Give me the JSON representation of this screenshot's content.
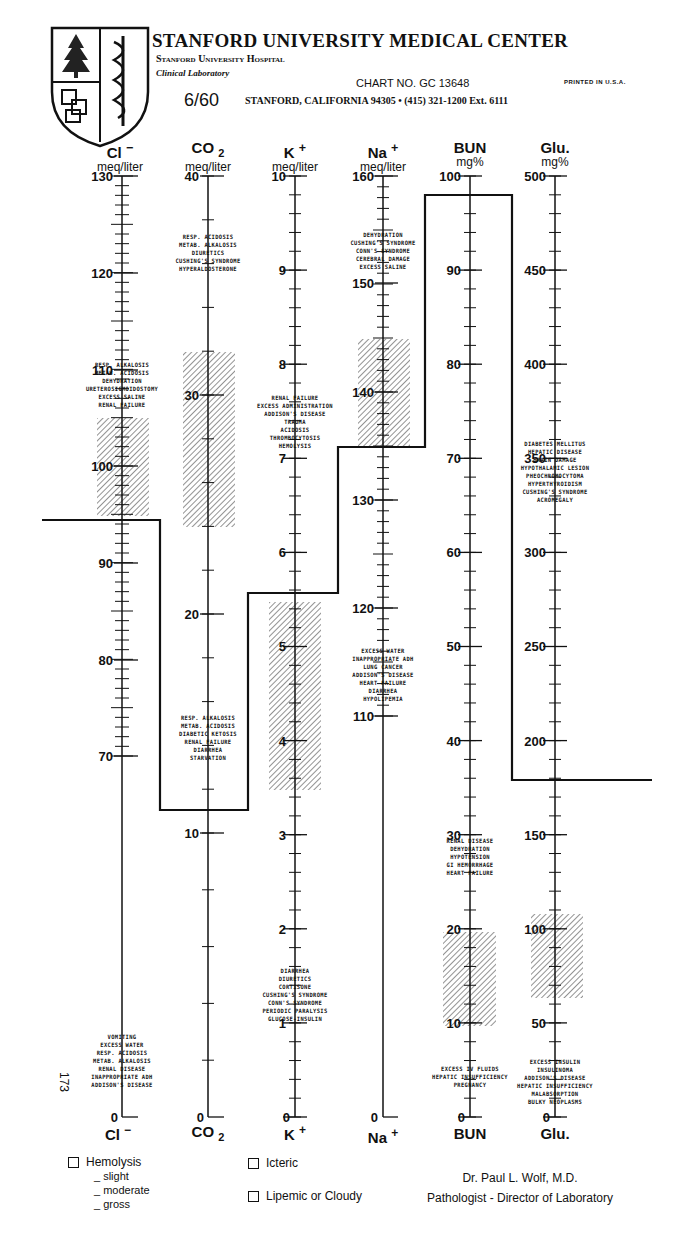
{
  "header": {
    "title": "STANFORD UNIVERSITY MEDICAL CENTER",
    "hospital": "Stanford University Hospital",
    "department": "Clinical Laboratory",
    "chart_number": "CHART NO. GC 13648",
    "printed": "PRINTED IN U.S.A.",
    "revision": "6/60",
    "address": "STANFORD, CALIFORNIA 94305 • (415) 321-1200 Ext. 6111",
    "logo": "stanford-shield-logo"
  },
  "columns": [
    {
      "symbol": "Cl",
      "charge": "−",
      "unit": "meq/liter",
      "foot": "Cl"
    },
    {
      "symbol": "CO",
      "sub": "2",
      "unit": "meq/liter",
      "foot": "CO"
    },
    {
      "symbol": "K",
      "charge": "+",
      "unit": "meq/liter",
      "foot": "K"
    },
    {
      "symbol": "Na",
      "charge": "+",
      "unit": "meq/liter",
      "foot": "Na"
    },
    {
      "symbol": "BUN",
      "unit": "mg%",
      "foot": "BUN"
    },
    {
      "symbol": "Glu.",
      "unit": "mg%",
      "foot": "Glu."
    }
  ],
  "side_number": "173",
  "diagnoses": {
    "cl_high": [
      "RESP. ALKALOSIS",
      "METAB. ACIDOSIS",
      "DEHYDRATION",
      "URETEROSIGMOIDOSTOMY",
      "EXCESS SALINE",
      "RENAL FAILURE"
    ],
    "cl_low": [
      "VOMITING",
      "EXCESS WATER",
      "RESP. ACIDOSIS",
      "METAB. ALKALOSIS",
      "RENAL DISEASE",
      "INAPPROPRIATE ADH",
      "ADDISON'S DISEASE"
    ],
    "co2_high": [
      "RESP. ACIDOSIS",
      "METAB. ALKALOSIS",
      "DIURETICS",
      "CUSHING'S SYNDROME",
      "HYPERALDOSTERONE"
    ],
    "co2_low": [
      "RESP. ALKALOSIS",
      "METAB. ACIDOSIS",
      "DIABETIC KETOSIS",
      "RENAL FAILURE",
      "DIARRHEA",
      "STARVATION"
    ],
    "k_high": [
      "RENAL FAILURE",
      "EXCESS ADMINISTRATION",
      "ADDISON'S DISEASE",
      "TRAUMA",
      "ACIDOSIS",
      "THROMBOCYTOSIS",
      "HEMOLYSIS"
    ],
    "k_low": [
      "DIARRHEA",
      "DIURETICS",
      "CORTISONE",
      "CUSHING'S SYNDROME",
      "CONN'S SYNDROME",
      "PERIODIC PARALYSIS",
      "GLUCOSE-INSULIN"
    ],
    "na_high": [
      "DEHYDRATION",
      "CUSHING'S SYNDROME",
      "CONN'S SYNDROME",
      "CEREBRAL DAMAGE",
      "EXCESS SALINE"
    ],
    "na_low": [
      "EXCESS WATER",
      "INAPPROPRIATE ADH",
      "LUNG CANCER",
      "ADDISON'S DISEASE",
      "HEART FAILURE",
      "DIARRHEA",
      "HYPOLIPEMIA"
    ],
    "bun_high": [
      "RENAL DISEASE",
      "DEHYDRATION",
      "HYPOTENSION",
      "GI HEMORRHAGE",
      "HEART FAILURE"
    ],
    "bun_low": [
      "EXCESS IV FLUIDS",
      "HEPATIC INSUFFICIENCY",
      "PREGNANCY"
    ],
    "glu_high": [
      "DIABETES MELLITUS",
      "HEPATIC DISEASE",
      "BRAIN DAMAGE",
      "HYPOTHALAMIC LESION",
      "PHEOCHROMOCYTOMA",
      "HYPERTHYROIDISM",
      "CUSHING'S SYNDROME",
      "ACROMEGALY"
    ],
    "glu_low": [
      "EXCESS INSULIN",
      "INSULINOMA",
      "ADDISON'S DISEASE",
      "HEPATIC INSUFFICIENCY",
      "MALABSORPTION",
      "BULKY NEOPLASMS"
    ]
  },
  "footer": {
    "hemolysis": "Hemolysis",
    "slight": "_ slight",
    "moderate": "_ moderate",
    "gross": "_ gross",
    "icteric": "Icteric",
    "lipemic": "Lipemic or Cloudy",
    "doctor": "Dr. Paul L. Wolf, M.D.",
    "doctor_title": "Pathologist - Director of Laboratory"
  },
  "chart_data": {
    "type": "line",
    "categories": [
      "Cl-",
      "CO2",
      "K+",
      "Na+",
      "BUN",
      "Glu."
    ],
    "units": [
      "meq/liter",
      "meq/liter",
      "meq/liter",
      "meq/liter",
      "mg%",
      "mg%"
    ],
    "axes": [
      {
        "name": "Cl-",
        "ticks": [
          0,
          70,
          80,
          90,
          100,
          110,
          120,
          130
        ],
        "normal_range": [
          95,
          105
        ]
      },
      {
        "name": "CO2",
        "ticks": [
          0,
          10,
          20,
          30,
          40
        ],
        "normal_range": [
          24,
          33
        ]
      },
      {
        "name": "K+",
        "ticks": [
          0,
          1,
          2,
          3,
          4,
          5,
          6,
          7,
          8,
          9,
          10
        ],
        "normal_range": [
          3.5,
          5.0
        ]
      },
      {
        "name": "Na+",
        "ticks": [
          0,
          110,
          120,
          130,
          140,
          150,
          160
        ],
        "normal_range": [
          136,
          145
        ]
      },
      {
        "name": "BUN",
        "ticks": [
          0,
          10,
          20,
          30,
          40,
          50,
          60,
          70,
          80,
          90,
          100
        ],
        "normal_range": [
          10,
          20
        ]
      },
      {
        "name": "Glu.",
        "ticks": [
          0,
          50,
          100,
          150,
          200,
          250,
          300,
          350,
          400,
          450,
          500
        ],
        "normal_range": [
          70,
          110
        ]
      }
    ],
    "series": [
      {
        "name": "Patient values (step line)",
        "values": [
          94,
          11,
          5.3,
          137,
          98,
          185
        ]
      }
    ],
    "xlabel": "",
    "ylabel": "",
    "grid": false,
    "legend": "none"
  }
}
